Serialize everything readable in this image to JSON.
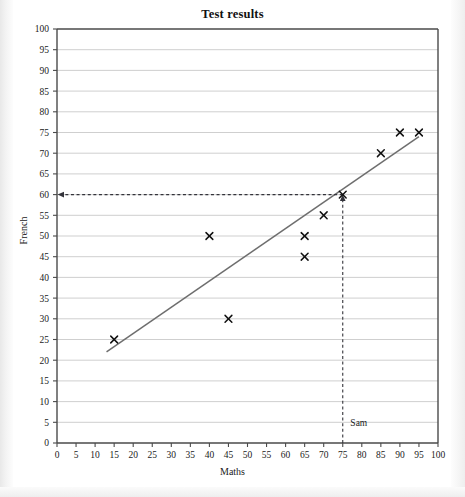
{
  "chart_data": {
    "type": "scatter",
    "title": "Test results",
    "xlabel": "Maths",
    "ylabel": "French",
    "xlim": [
      0,
      100
    ],
    "ylim": [
      0,
      100
    ],
    "xtick_step": 5,
    "ytick_step": 5,
    "xticks": [
      0,
      5,
      10,
      15,
      20,
      25,
      30,
      35,
      40,
      45,
      50,
      55,
      60,
      65,
      70,
      75,
      80,
      85,
      90,
      95,
      100
    ],
    "yticks": [
      0,
      5,
      10,
      15,
      20,
      25,
      30,
      35,
      40,
      45,
      50,
      55,
      60,
      65,
      70,
      75,
      80,
      85,
      90,
      95,
      100
    ],
    "grid": "horizontal",
    "legend": "none",
    "marker": "x",
    "points": [
      {
        "x": 15,
        "y": 25
      },
      {
        "x": 40,
        "y": 50
      },
      {
        "x": 45,
        "y": 30
      },
      {
        "x": 65,
        "y": 45
      },
      {
        "x": 65,
        "y": 50
      },
      {
        "x": 70,
        "y": 55
      },
      {
        "x": 75,
        "y": 60
      },
      {
        "x": 85,
        "y": 70
      },
      {
        "x": 90,
        "y": 75
      },
      {
        "x": 95,
        "y": 75
      }
    ],
    "line_of_best_fit": {
      "label": "line of best fit",
      "start": {
        "x": 13,
        "y": 22
      },
      "end": {
        "x": 95,
        "y": 74
      },
      "color": "#6e6e6e"
    },
    "annotations": [
      {
        "name": "sam-construction-lines",
        "label": "Sam",
        "label_x": 77,
        "label_y": 4,
        "vertical_from": {
          "x": 75,
          "y": 0
        },
        "vertical_to": {
          "x": 75,
          "y": 60
        },
        "horizontal_from": {
          "x": 75,
          "y": 60
        },
        "horizontal_to": {
          "x": 0,
          "y": 60
        },
        "read_off_maths": 75,
        "read_off_french": 60,
        "style": "dashed-with-arrowheads",
        "color": "#33333a"
      }
    ],
    "colors": {
      "axis": "#4a4a4a",
      "grid": "#c9c9c9",
      "marker": "#111111",
      "trendline": "#6e6e6e",
      "annotation": "#33333a",
      "background": "#ffffff"
    }
  },
  "page": {
    "title": "Test results",
    "y_axis_label": "French",
    "x_axis_label": "Maths",
    "sam_label": "Sam"
  },
  "tick_labels": {
    "x": [
      "0",
      "5",
      "10",
      "15",
      "20",
      "25",
      "30",
      "35",
      "40",
      "45",
      "50",
      "55",
      "60",
      "65",
      "70",
      "75",
      "80",
      "85",
      "90",
      "95",
      "100"
    ],
    "y": [
      "0",
      "5",
      "10",
      "15",
      "20",
      "25",
      "30",
      "35",
      "40",
      "45",
      "50",
      "55",
      "60",
      "65",
      "70",
      "75",
      "80",
      "85",
      "90",
      "95",
      "100"
    ]
  }
}
